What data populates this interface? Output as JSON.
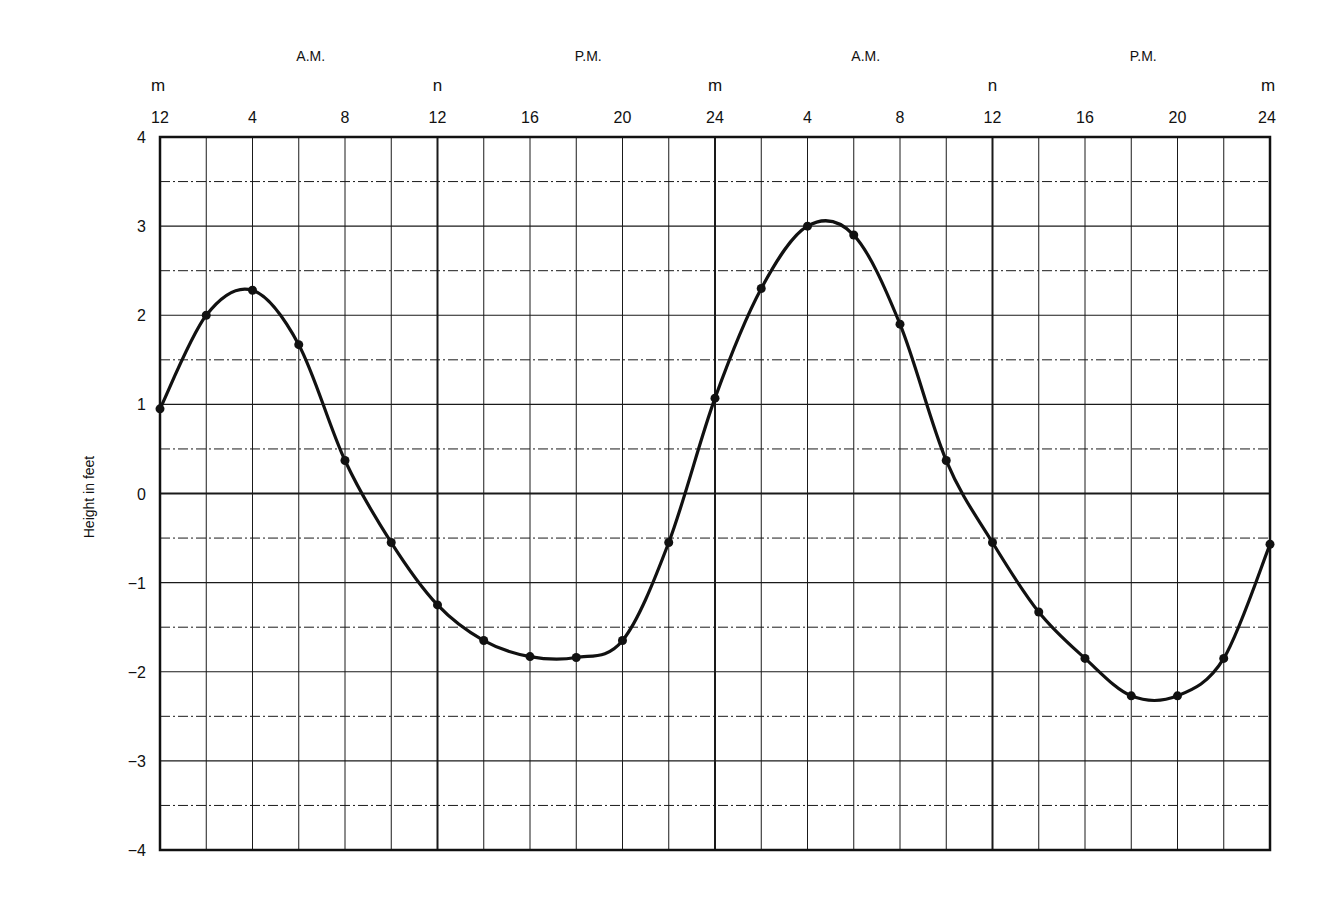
{
  "chart_data": {
    "type": "line",
    "title": "",
    "xlabel": "",
    "ylabel": "Height in feet",
    "ylim": [
      -4,
      4
    ],
    "xlim": [
      0,
      48
    ],
    "grid": true,
    "y_ticks": [
      "4",
      "3",
      "2",
      "1",
      "0",
      "−1",
      "−2",
      "−3",
      "−4"
    ],
    "y_tick_values": [
      4,
      3,
      2,
      1,
      0,
      -1,
      -2,
      -3,
      -4
    ],
    "x_ticks": [
      {
        "hour": 0,
        "label": "12"
      },
      {
        "hour": 4,
        "label": "4"
      },
      {
        "hour": 8,
        "label": "8"
      },
      {
        "hour": 12,
        "label": "12"
      },
      {
        "hour": 16,
        "label": "16"
      },
      {
        "hour": 20,
        "label": "20"
      },
      {
        "hour": 24,
        "label": "24"
      },
      {
        "hour": 28,
        "label": "4"
      },
      {
        "hour": 32,
        "label": "8"
      },
      {
        "hour": 36,
        "label": "12"
      },
      {
        "hour": 40,
        "label": "16"
      },
      {
        "hour": 44,
        "label": "20"
      },
      {
        "hour": 48,
        "label": "24"
      }
    ],
    "midnight_noon_markers": [
      {
        "hour": 0,
        "label": "m"
      },
      {
        "hour": 12,
        "label": "n"
      },
      {
        "hour": 24,
        "label": "m"
      },
      {
        "hour": 36,
        "label": "n"
      },
      {
        "hour": 48,
        "label": "m"
      }
    ],
    "period_labels": [
      {
        "hour": 6,
        "label": "A.M."
      },
      {
        "hour": 18,
        "label": "P.M."
      },
      {
        "hour": 30,
        "label": "A.M."
      },
      {
        "hour": 42,
        "label": "P.M."
      }
    ],
    "series": [
      {
        "name": "Tide height",
        "x": [
          0,
          2,
          4,
          6,
          8,
          10,
          12,
          14,
          16,
          18,
          20,
          22,
          24,
          26,
          28,
          30,
          32,
          34,
          36,
          38,
          40,
          42,
          44,
          46,
          48
        ],
        "values": [
          0.95,
          2.0,
          2.28,
          1.67,
          0.37,
          -0.55,
          -1.25,
          -1.65,
          -1.83,
          -1.84,
          -1.65,
          -0.55,
          1.07,
          2.3,
          3.0,
          2.9,
          1.9,
          0.37,
          -0.55,
          -1.33,
          -1.85,
          -2.27,
          -2.27,
          -1.85,
          -0.57
        ]
      }
    ]
  }
}
